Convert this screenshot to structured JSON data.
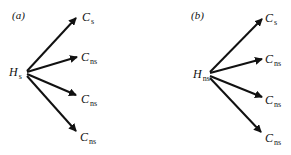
{
  "diagram": {
    "panels": [
      {
        "tag": "(a)",
        "source": {
          "symbol": "H",
          "subscript": "s"
        },
        "targets": [
          {
            "symbol": "C",
            "subscript": "s"
          },
          {
            "symbol": "C",
            "subscript": "ns"
          },
          {
            "symbol": "C",
            "subscript": "ns"
          },
          {
            "symbol": "C",
            "subscript": "ns"
          }
        ]
      },
      {
        "tag": "(b)",
        "source": {
          "symbol": "H",
          "subscript": "ns"
        },
        "targets": [
          {
            "symbol": "C",
            "subscript": "s"
          },
          {
            "symbol": "C",
            "subscript": "ns"
          },
          {
            "symbol": "C",
            "subscript": "ns"
          },
          {
            "symbol": "C",
            "subscript": "ns"
          }
        ]
      }
    ],
    "colors": {
      "arrow": "#111111",
      "background": "#ffffff"
    }
  }
}
